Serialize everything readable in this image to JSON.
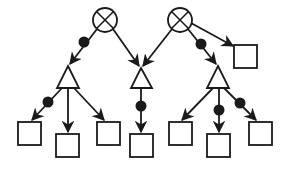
{
  "diagram": {
    "title": "",
    "colors": {
      "stroke": "#1a1a1a",
      "background": "#ffffff",
      "dot": "#1a1a1a"
    },
    "nodes": [
      {
        "id": "x1",
        "type": "crossed-circle",
        "x": 105,
        "y": 20,
        "r": 12
      },
      {
        "id": "x2",
        "type": "crossed-circle",
        "x": 180,
        "y": 20,
        "r": 12
      },
      {
        "id": "t1",
        "type": "triangle",
        "apex": [
          68,
          66
        ],
        "base": [
          57,
          79,
          88
        ]
      },
      {
        "id": "t2",
        "type": "triangle",
        "apex": [
          141,
          68
        ],
        "base": [
          131,
          152,
          88
        ]
      },
      {
        "id": "t3",
        "type": "triangle",
        "apex": [
          218,
          66
        ],
        "base": [
          207,
          229,
          88
        ]
      },
      {
        "id": "s0",
        "type": "square",
        "x": 234,
        "y": 45,
        "w": 23,
        "h": 23
      },
      {
        "id": "s1",
        "type": "square",
        "x": 18,
        "y": 122,
        "w": 23,
        "h": 23
      },
      {
        "id": "s2",
        "type": "square",
        "x": 56,
        "y": 134,
        "w": 23,
        "h": 23
      },
      {
        "id": "s3",
        "type": "square",
        "x": 97,
        "y": 122,
        "w": 23,
        "h": 23
      },
      {
        "id": "s4",
        "type": "square",
        "x": 130,
        "y": 134,
        "w": 23,
        "h": 23
      },
      {
        "id": "s5",
        "type": "square",
        "x": 169,
        "y": 122,
        "w": 23,
        "h": 23
      },
      {
        "id": "s6",
        "type": "square",
        "x": 207,
        "y": 134,
        "w": 23,
        "h": 23
      },
      {
        "id": "s7",
        "type": "square",
        "x": 249,
        "y": 122,
        "w": 23,
        "h": 23
      }
    ],
    "edges": [
      {
        "from": [
          97,
          29
        ],
        "to": [
          70,
          64
        ],
        "dot": [
          84,
          42
        ]
      },
      {
        "from": [
          113,
          29
        ],
        "to": [
          139,
          66
        ],
        "dot": null
      },
      {
        "from": [
          172,
          29
        ],
        "to": [
          143,
          66
        ],
        "dot": null
      },
      {
        "from": [
          188,
          29
        ],
        "to": [
          216,
          64
        ],
        "dot": [
          201,
          44
        ]
      },
      {
        "from": [
          191,
          23
        ],
        "to": [
          233,
          46
        ],
        "dot": null
      },
      {
        "from": [
          62,
          88
        ],
        "to": [
          32,
          120
        ],
        "dot": [
          48,
          102
        ]
      },
      {
        "from": [
          68,
          88
        ],
        "to": [
          68,
          132
        ],
        "dot": null
      },
      {
        "from": [
          74,
          88
        ],
        "to": [
          104,
          120
        ],
        "dot": null
      },
      {
        "from": [
          141,
          88
        ],
        "to": [
          141,
          132
        ],
        "dot": [
          141,
          106
        ]
      },
      {
        "from": [
          213,
          88
        ],
        "to": [
          182,
          120
        ],
        "dot": null
      },
      {
        "from": [
          219,
          88
        ],
        "to": [
          219,
          132
        ],
        "dot": [
          219,
          110
        ]
      },
      {
        "from": [
          224,
          88
        ],
        "to": [
          256,
          120
        ],
        "dot": [
          240,
          103
        ]
      }
    ]
  }
}
